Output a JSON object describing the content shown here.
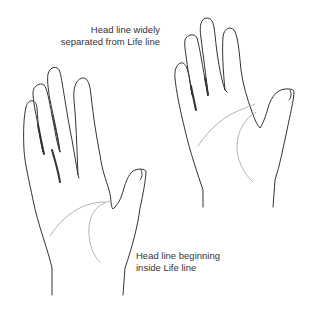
{
  "captions": {
    "widely_separated": {
      "line1": "Head line widely",
      "line2": "separated from Life line"
    },
    "beginning_inside": {
      "line1": "Head line beginning",
      "line2": "inside Life line"
    }
  },
  "figures": [
    {
      "id": "hand-left",
      "label": "Head line beginning inside Life line"
    },
    {
      "id": "hand-right",
      "label": "Head line widely separated from Life line"
    }
  ],
  "colors": {
    "outline": "#333333",
    "palm_lines": "#aaaaaa",
    "text": "#333333",
    "background": "#ffffff"
  }
}
